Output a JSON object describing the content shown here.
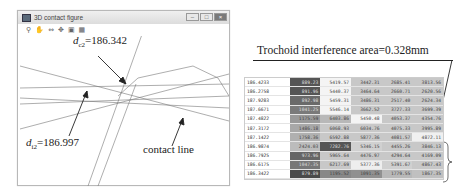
{
  "window": {
    "title": "3D contact figure",
    "controls": {
      "minimize": "–",
      "maximize": "□",
      "close": "×"
    },
    "toolbar": [
      {
        "name": "zoom-icon",
        "glyph": "⚲"
      },
      {
        "name": "pan-hand-icon",
        "glyph": "✋"
      },
      {
        "name": "fit-icon",
        "glyph": "⇔"
      },
      {
        "name": "rotate-icon",
        "glyph": "✥"
      },
      {
        "name": "save-icon",
        "glyph": "▣"
      },
      {
        "name": "grid-icon",
        "glyph": "▦"
      }
    ]
  },
  "plot": {
    "label_dc2": {
      "var": "d",
      "sub": "c2",
      "value": "=186.342"
    },
    "label_di2": {
      "var": "d",
      "sub": "i2",
      "value": "=186.997"
    },
    "label_contact": "contact line"
  },
  "annotation": "Trochoid interference area=0.328mm",
  "table": {
    "rows": [
      {
        "key": "186.4233",
        "cells": [
          "889.23",
          "5419.57",
          "3442.31",
          "2685.41",
          "3813.56"
        ],
        "shades": [
          "#555",
          "#f4f4f4",
          "#c8c8c8",
          "#c8c8c8",
          "#c8c8c8"
        ]
      },
      {
        "key": "186.2758",
        "cells": [
          "891.96",
          "5440.37",
          "3464.64",
          "2660.71",
          "2620.56"
        ],
        "shades": [
          "#555",
          "#f4f4f4",
          "#c8c8c8",
          "#c8c8c8",
          "#c8c8c8"
        ]
      },
      {
        "key": "187.9283",
        "cells": [
          "892.98",
          "5459.31",
          "3486.31",
          "2517.40",
          "2624.34"
        ],
        "shades": [
          "#6a6a6a",
          "#f4f4f4",
          "#c8c8c8",
          "#c8c8c8",
          "#c8c8c8"
        ]
      },
      {
        "key": "187.6671",
        "cells": [
          "1041.25",
          "5546.14",
          "3662.52",
          "3727.33",
          "3699.39"
        ],
        "shades": [
          "#7a7a7a",
          "#f4f4f4",
          "#c8c8c8",
          "#c8c8c8",
          "#c8c8c8"
        ]
      },
      {
        "key": "187.4822",
        "cells": [
          "1175.59",
          "6403.86",
          "5450.48",
          "4053.37",
          "4354.76"
        ],
        "shades": [
          "#999",
          "#b8b8b8",
          "#f4f4f4",
          "#c8c8c8",
          "#c8c8c8"
        ]
      },
      {
        "key": "187.3172",
        "cells": [
          "1486.18",
          "6068.93",
          "6034.76",
          "4075.33",
          "3995.89"
        ],
        "shades": [
          "#a8a8a8",
          "#c8c8c8",
          "#c8c8c8",
          "#c8c8c8",
          "#c8c8c8"
        ]
      },
      {
        "key": "187.1422",
        "cells": [
          "1758.36",
          "6592.88",
          "5877.36",
          "4081.57",
          "4872.11"
        ],
        "shades": [
          "#b0b0b0",
          "#c8c8c8",
          "#c8c8c8",
          "#c8c8c8",
          "#f0f0f0"
        ]
      },
      {
        "key": "186.9874",
        "cells": [
          "2424.03",
          "7282.76",
          "5346.15",
          "4455.26",
          "3846.13"
        ],
        "shades": [
          "#bcbcbc",
          "#555",
          "#d0d0d0",
          "#c8c8c8",
          "#c8c8c8"
        ]
      },
      {
        "key": "186.7925",
        "cells": [
          "973.96",
          "5965.64",
          "4476.97",
          "4294.64",
          "4169.09"
        ],
        "shades": [
          "#666",
          "#c8c8c8",
          "#c8c8c8",
          "#c8c8c8",
          "#c8c8c8"
        ]
      },
      {
        "key": "186.6175",
        "cells": [
          "1047.35",
          "6217.69",
          "5377.36",
          "5391.67",
          "4867.43"
        ],
        "shades": [
          "#777",
          "#c8c8c8",
          "#eeeeee",
          "#d0d0d0",
          "#c8c8c8"
        ]
      },
      {
        "key": "186.3422",
        "cells": [
          "879.89",
          "1195.52",
          "1091.35",
          "1779.55",
          "1867.35"
        ],
        "shades": [
          "#4a4a4a",
          "#888",
          "#909090",
          "#b8b8b8",
          "#c0c0c0"
        ]
      }
    ]
  }
}
